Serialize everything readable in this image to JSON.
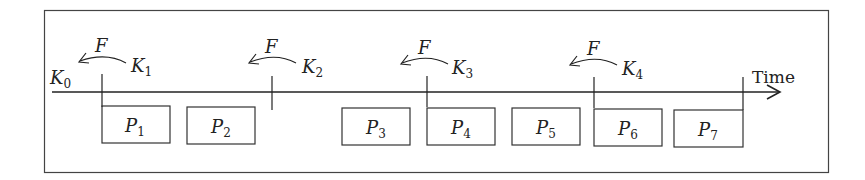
{
  "diagram": {
    "axis_label": "Time",
    "start_label": {
      "base": "K",
      "sub": "0"
    },
    "checkpoints": [
      {
        "base": "K",
        "sub": "1",
        "arrow_label": "F"
      },
      {
        "base": "K",
        "sub": "2",
        "arrow_label": "F"
      },
      {
        "base": "K",
        "sub": "3",
        "arrow_label": "F"
      },
      {
        "base": "K",
        "sub": "4",
        "arrow_label": "F"
      }
    ],
    "processes": [
      {
        "base": "P",
        "sub": "1"
      },
      {
        "base": "P",
        "sub": "2"
      },
      {
        "base": "P",
        "sub": "3"
      },
      {
        "base": "P",
        "sub": "4"
      },
      {
        "base": "P",
        "sub": "5"
      },
      {
        "base": "P",
        "sub": "6"
      },
      {
        "base": "P",
        "sub": "7"
      }
    ],
    "colors": {
      "stroke": "#333333",
      "background": "#ffffff"
    }
  }
}
